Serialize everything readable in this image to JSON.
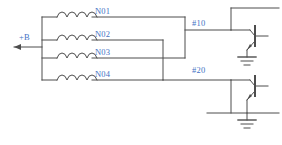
{
  "diagram": {
    "colors": {
      "wire": "#4d4d4d",
      "label": "#4472c4",
      "background": "#ffffff"
    },
    "supply": {
      "label": "+B",
      "arrow": "left-arrow"
    },
    "coils": [
      {
        "id": "N01",
        "label": "N01",
        "y": 17
      },
      {
        "id": "N02",
        "label": "N02",
        "y": 40
      },
      {
        "id": "N03",
        "label": "N03",
        "y": 58
      },
      {
        "id": "N04",
        "label": "N04",
        "y": 80
      }
    ],
    "nodes": [
      {
        "id": "n10",
        "label": "#10",
        "y": 30,
        "sources": [
          "N01",
          "N03"
        ]
      },
      {
        "id": "n20",
        "label": "#20",
        "y": 80,
        "sources": [
          "N02",
          "N04"
        ]
      }
    ],
    "transistors": [
      {
        "id": "q1",
        "type": "npn",
        "base_from": "#10",
        "emitter": "ground"
      },
      {
        "id": "q2",
        "type": "npn",
        "base_from": "#20",
        "emitter": "ground"
      }
    ],
    "grounds": [
      {
        "id": "gnd1",
        "symbol": "earth-ground"
      },
      {
        "id": "gnd2",
        "symbol": "earth-ground"
      }
    ]
  }
}
